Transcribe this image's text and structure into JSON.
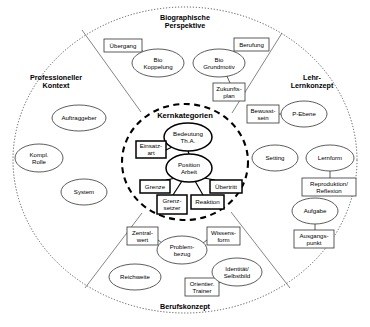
{
  "diagram": {
    "title_core": "Kernkategorien",
    "sectors": [
      {
        "id": "biographische",
        "label": "Biographische\nPerspektive",
        "x": 185,
        "y": 22
      },
      {
        "id": "professioneller",
        "label": "Professioneller\nKontext",
        "x": 56,
        "y": 82
      },
      {
        "id": "lehr",
        "label": "Lehr-\nLernkonzept",
        "x": 312,
        "y": 82
      },
      {
        "id": "berufskonzept",
        "label": "Berufskonzept",
        "x": 185,
        "y": 307
      }
    ],
    "core": {
      "label": "Kernkategorien",
      "label_x": 185,
      "label_y": 116,
      "circle": {
        "cx": 185,
        "cy": 162,
        "rx": 63,
        "ry": 58
      },
      "nodes": [
        {
          "id": "bedeutung",
          "shape": "ellipse",
          "text": "Bedeutung\nTh.A.",
          "cx": 188,
          "cy": 137,
          "rx": 24,
          "ry": 14
        },
        {
          "id": "position-arbeit",
          "shape": "ellipse",
          "text": "Position\nArbeit",
          "cx": 189,
          "cy": 168,
          "rx": 23,
          "ry": 14
        },
        {
          "id": "einsatzart",
          "shape": "rect",
          "text": "Einsatz-\nart",
          "x": 136,
          "y": 141,
          "w": 30,
          "h": 17
        },
        {
          "id": "grenze",
          "shape": "rect",
          "text": "Grenze",
          "x": 140,
          "y": 180,
          "w": 30,
          "h": 13
        },
        {
          "id": "uebertritt",
          "shape": "rect",
          "text": "Übertritt",
          "x": 210,
          "y": 180,
          "w": 32,
          "h": 13
        },
        {
          "id": "grenzsetzer",
          "shape": "rect",
          "text": "Grenz-\nsetzer",
          "x": 157,
          "y": 195,
          "w": 30,
          "h": 19
        },
        {
          "id": "reaktion",
          "shape": "rect",
          "text": "Reaktion",
          "x": 191,
          "y": 195,
          "w": 33,
          "h": 14
        }
      ]
    },
    "nodes": [
      {
        "id": "uebergang",
        "sector": "biographische",
        "shape": "rect",
        "text": "Übergang",
        "x": 104,
        "y": 39,
        "w": 38,
        "h": 13
      },
      {
        "id": "bio-koppelung",
        "sector": "biographische",
        "shape": "ellipse",
        "text": "Bio\nKoppelung",
        "cx": 158,
        "cy": 63,
        "rx": 26,
        "ry": 14
      },
      {
        "id": "bio-grundmotiv",
        "sector": "biographische",
        "shape": "ellipse",
        "text": "Bio\nGrundmotiv",
        "cx": 219,
        "cy": 63,
        "rx": 26,
        "ry": 14
      },
      {
        "id": "berufung",
        "sector": "biographische",
        "shape": "rect",
        "text": "Berufung",
        "x": 234,
        "y": 38,
        "w": 35,
        "h": 13
      },
      {
        "id": "zukunftsplan",
        "sector": "biographische",
        "shape": "rect",
        "text": "Zukunfts-\nplan",
        "x": 213,
        "y": 83,
        "w": 32,
        "h": 18
      },
      {
        "id": "auftraggeber",
        "sector": "professioneller",
        "shape": "ellipse",
        "text": "Auftraggeber",
        "cx": 79,
        "cy": 118,
        "rx": 27,
        "ry": 13
      },
      {
        "id": "kompl-rolle",
        "sector": "professioneller",
        "shape": "ellipse",
        "text": "Kompl.\nRolle",
        "cx": 39,
        "cy": 158,
        "rx": 24,
        "ry": 14
      },
      {
        "id": "system",
        "sector": "professioneller",
        "shape": "ellipse",
        "text": "System",
        "cx": 84,
        "cy": 192,
        "rx": 23,
        "ry": 13
      },
      {
        "id": "bewusstsein",
        "sector": "lehr",
        "shape": "rect",
        "text": "Bewusst-\nsein",
        "x": 247,
        "y": 105,
        "w": 32,
        "h": 18
      },
      {
        "id": "p-ebene",
        "sector": "lehr",
        "shape": "ellipse",
        "text": "P-Ebene",
        "cx": 304,
        "cy": 114,
        "rx": 23,
        "ry": 13
      },
      {
        "id": "setting",
        "sector": "lehr",
        "shape": "ellipse",
        "text": "Setting",
        "cx": 275,
        "cy": 158,
        "rx": 23,
        "ry": 13
      },
      {
        "id": "lernform",
        "sector": "lehr",
        "shape": "ellipse",
        "text": "Lernform",
        "cx": 330,
        "cy": 158,
        "rx": 24,
        "ry": 13
      },
      {
        "id": "reproduktion-reflexion",
        "sector": "lehr",
        "shape": "rect",
        "text": "Reproduktion/\nReflexion",
        "x": 302,
        "y": 178,
        "w": 54,
        "h": 18
      },
      {
        "id": "aufgabe",
        "sector": "lehr",
        "shape": "ellipse",
        "text": "Aufgabe",
        "cx": 315,
        "cy": 211,
        "rx": 23,
        "ry": 13
      },
      {
        "id": "ausgangspunkt",
        "sector": "lehr",
        "shape": "rect",
        "text": "Ausgangs-\npunkt",
        "x": 294,
        "y": 230,
        "w": 40,
        "h": 18
      },
      {
        "id": "zentralwert",
        "sector": "berufskonzept",
        "shape": "rect",
        "text": "Zentral-\nwert",
        "x": 127,
        "y": 227,
        "w": 31,
        "h": 18
      },
      {
        "id": "wissensform",
        "sector": "berufskonzept",
        "shape": "rect",
        "text": "Wissens-\nform",
        "x": 207,
        "y": 227,
        "w": 33,
        "h": 18
      },
      {
        "id": "problembezug",
        "sector": "berufskonzept",
        "shape": "ellipse",
        "text": "Problem-\nbezug",
        "cx": 182,
        "cy": 250,
        "rx": 25,
        "ry": 14
      },
      {
        "id": "reichweite",
        "sector": "berufskonzept",
        "shape": "ellipse",
        "text": "Reichweite",
        "cx": 135,
        "cy": 277,
        "rx": 26,
        "ry": 13
      },
      {
        "id": "orientier-trainer",
        "sector": "berufskonzept",
        "shape": "rect",
        "text": "Orientier.\nTrainer",
        "x": 185,
        "y": 278,
        "w": 34,
        "h": 18
      },
      {
        "id": "identitaet-selbstbild",
        "sector": "berufskonzept",
        "shape": "ellipse",
        "text": "Identität/\nSelbstbild",
        "cx": 237,
        "cy": 272,
        "rx": 25,
        "ry": 14
      }
    ],
    "connectors": [
      {
        "from": "uebergang",
        "to": "bio-koppelung",
        "x1": 140,
        "y1": 49,
        "x2": 147,
        "y2": 54
      },
      {
        "from": "berufung",
        "to": "bio-grundmotiv",
        "x1": 236,
        "y1": 50,
        "x2": 228,
        "y2": 55
      },
      {
        "from": "bio-grundmotiv",
        "to": "zukunftsplan",
        "x1": 226,
        "y1": 74,
        "x2": 230,
        "y2": 83
      },
      {
        "from": "bewusstsein",
        "to": "p-ebene",
        "x1": 279,
        "y1": 114,
        "x2": 281,
        "y2": 114
      },
      {
        "from": "lernform",
        "to": "reproduktion-reflexion",
        "x1": 330,
        "y1": 171,
        "x2": 330,
        "y2": 178
      },
      {
        "from": "aufgabe",
        "to": "ausgangspunkt",
        "x1": 315,
        "y1": 224,
        "x2": 315,
        "y2": 230
      },
      {
        "from": "zentralwert",
        "to": "problembezug",
        "x1": 158,
        "y1": 240,
        "x2": 166,
        "y2": 246
      },
      {
        "from": "wissensform",
        "to": "problembezug",
        "x1": 207,
        "y1": 240,
        "x2": 199,
        "y2": 246
      },
      {
        "from": "orientier-trainer",
        "to": "identitaet-selbstbild",
        "x1": 219,
        "y1": 283,
        "x2": 224,
        "y2": 279
      }
    ],
    "core_connectors": [
      {
        "from": "einsatzart",
        "to": "bedeutung",
        "x1": 166,
        "y1": 150,
        "x2": 174,
        "y2": 146
      },
      {
        "from": "position-arbeit",
        "to": "grenze",
        "x1": 176,
        "y1": 178,
        "x2": 166,
        "y2": 180
      },
      {
        "from": "position-arbeit",
        "to": "grenzsetzer",
        "x1": 182,
        "y1": 181,
        "x2": 173,
        "y2": 195
      },
      {
        "from": "position-arbeit",
        "to": "reaktion",
        "x1": 195,
        "y1": 181,
        "x2": 203,
        "y2": 195
      },
      {
        "from": "position-arbeit",
        "to": "uebertritt",
        "x1": 204,
        "y1": 178,
        "x2": 215,
        "y2": 180
      },
      {
        "from": "bedeutung",
        "to": "position-arbeit",
        "x1": 188,
        "y1": 151,
        "x2": 189,
        "y2": 154
      }
    ],
    "dividers": [
      {
        "id": "divider-top-left",
        "x1": 141,
        "y1": 112,
        "x2": 82,
        "y2": 30
      },
      {
        "id": "divider-top-right",
        "x1": 232,
        "y1": 113,
        "x2": 282,
        "y2": 33
      },
      {
        "id": "divider-bottom-left",
        "x1": 142,
        "y1": 213,
        "x2": 85,
        "y2": 288
      },
      {
        "id": "divider-bottom-right",
        "x1": 231,
        "y1": 212,
        "x2": 290,
        "y2": 288
      }
    ],
    "outer_circle": {
      "cx": 185,
      "cy": 160,
      "rx": 172,
      "ry": 153
    }
  }
}
